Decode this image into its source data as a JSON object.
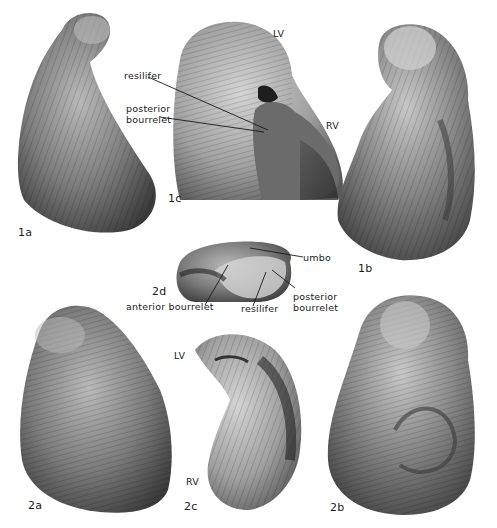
{
  "plate": {
    "figures": [
      {
        "id": "1a",
        "label": "1a"
      },
      {
        "id": "1b",
        "label": "1b"
      },
      {
        "id": "1c",
        "label": "1c"
      },
      {
        "id": "2a",
        "label": "2a"
      },
      {
        "id": "2b",
        "label": "2b"
      },
      {
        "id": "2c",
        "label": "2c"
      },
      {
        "id": "2d",
        "label": "2d"
      }
    ],
    "annotations": {
      "fig1c": {
        "lv": "LV",
        "rv": "RV",
        "resilifer": "resilifer",
        "posterior_1": "posterior",
        "posterior_2": "bourrelet"
      },
      "fig2d": {
        "umbo": "umbo",
        "anterior": "anterior bourrelet",
        "resilifer": "resilifer",
        "posterior_1": "posterior",
        "posterior_2": "bourrelet"
      },
      "fig2c": {
        "lv": "LV",
        "rv": "RV"
      }
    }
  }
}
